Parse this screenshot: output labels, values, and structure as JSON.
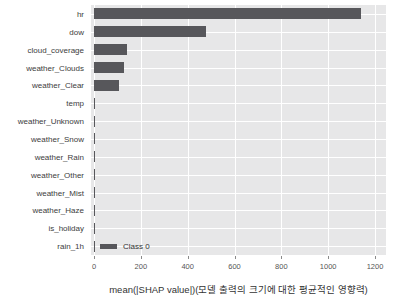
{
  "chart_data": {
    "type": "bar",
    "orientation": "horizontal",
    "title": "",
    "categories": [
      "hr",
      "dow",
      "cloud_coverage",
      "weather_Clouds",
      "weather_Clear",
      "temp",
      "weather_Unknown",
      "weather_Snow",
      "weather_Rain",
      "weather_Other",
      "weather_Mist",
      "weather_Haze",
      "is_holiday",
      "rain_1h"
    ],
    "values": [
      1140,
      478,
      140,
      130,
      105,
      4,
      3,
      2,
      2,
      2,
      1,
      1,
      1,
      1
    ],
    "xlabel": "mean(|SHAP value|)(모델 출력의 크기에 대한 평균적인 영향력)",
    "ylabel": "",
    "x_ticks": [
      0,
      200,
      400,
      600,
      800,
      1000,
      1200
    ],
    "xlim": [
      0,
      1200
    ],
    "grid": true,
    "legend": {
      "position": "lower left",
      "entries": [
        {
          "label": "Class 0",
          "color": "#57575b"
        }
      ]
    },
    "bar_color": "#57575b",
    "plot_background": "#e7e7e8",
    "grid_color": "#ffffff"
  }
}
